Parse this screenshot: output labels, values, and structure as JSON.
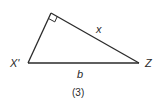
{
  "figure": {
    "caption": "(3)",
    "triangle": {
      "type": "right-triangle",
      "vertices": {
        "right_angle": {
          "x": 51,
          "y": 13,
          "label": ""
        },
        "left": {
          "x": 28,
          "y": 63,
          "label": "X'"
        },
        "right": {
          "x": 139,
          "y": 63,
          "label": "Z"
        }
      },
      "sides": {
        "hypotenuse_top": {
          "label": "x"
        },
        "base": {
          "label": "b"
        }
      },
      "right_angle_marker": true
    },
    "colors": {
      "stroke": "#2a2a2a",
      "background": "#ffffff"
    }
  }
}
